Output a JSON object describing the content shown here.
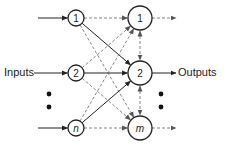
{
  "diagram": {
    "type": "neural-network",
    "labels": {
      "inputs": "Inputs",
      "outputs": "Outputs"
    },
    "input_nodes": [
      {
        "id": "in1",
        "label": "1",
        "italic": false
      },
      {
        "id": "in2",
        "label": "2",
        "italic": false
      },
      {
        "id": "inn",
        "label": "n",
        "italic": true
      }
    ],
    "output_nodes": [
      {
        "id": "out1",
        "label": "1",
        "italic": false
      },
      {
        "id": "out2",
        "label": "2",
        "italic": false
      },
      {
        "id": "outm",
        "label": "m",
        "italic": true
      }
    ],
    "connections": [
      {
        "from": "in1",
        "to": "out1",
        "style": "dashed"
      },
      {
        "from": "in1",
        "to": "out2",
        "style": "solid"
      },
      {
        "from": "in1",
        "to": "outm",
        "style": "dashed"
      },
      {
        "from": "in2",
        "to": "out1",
        "style": "dashed"
      },
      {
        "from": "in2",
        "to": "out2",
        "style": "solid"
      },
      {
        "from": "in2",
        "to": "outm",
        "style": "dashed"
      },
      {
        "from": "inn",
        "to": "out1",
        "style": "dashed"
      },
      {
        "from": "inn",
        "to": "out2",
        "style": "solid"
      },
      {
        "from": "inn",
        "to": "outm",
        "style": "dashed"
      }
    ],
    "lateral_connections": [
      {
        "from": "out1",
        "to": "out2",
        "style": "dashed",
        "bidirectional": true
      },
      {
        "from": "out2",
        "to": "outm",
        "style": "dashed",
        "bidirectional": true
      }
    ],
    "input_arrows_style": "solid",
    "output_arrows": [
      {
        "from": "out1",
        "style": "dashed"
      },
      {
        "from": "out2",
        "style": "solid"
      },
      {
        "from": "outm",
        "style": "dashed"
      }
    ],
    "ellipsis_dots": 2,
    "colors": {
      "stroke": "#222222",
      "dashed": "#777777",
      "background": "#ffffff"
    }
  }
}
